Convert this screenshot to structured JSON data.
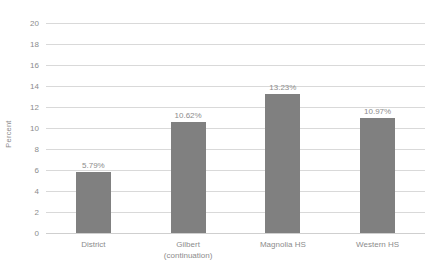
{
  "chart_data": {
    "type": "bar",
    "title": "",
    "subtitle": "",
    "xlabel": "",
    "ylabel": "Percent",
    "ylim": [
      0,
      20
    ],
    "ytick_step": 2,
    "yticks": [
      "20",
      "18",
      "16",
      "14",
      "12",
      "10",
      "8",
      "6",
      "4",
      "2",
      "0"
    ],
    "grid": true,
    "legend": false,
    "categories": [
      "District",
      "Gilbert (continuation)",
      "Magnolia HS",
      "Western HS"
    ],
    "values": [
      5.79,
      10.62,
      13.23,
      10.97
    ],
    "data_labels": [
      "5.79%",
      "10.62%",
      "13.23%",
      "10.97%"
    ],
    "bars": [
      {
        "category_line1": "District",
        "category_line2": "",
        "value": 5.79,
        "label": "5.79%"
      },
      {
        "category_line1": "Gilbert",
        "category_line2": "(continuation)",
        "value": 10.62,
        "label": "10.62%"
      },
      {
        "category_line1": "Magnolia HS",
        "category_line2": "",
        "value": 13.23,
        "label": "13.23%"
      },
      {
        "category_line1": "Western HS",
        "category_line2": "",
        "value": 10.97,
        "label": "10.97%"
      }
    ],
    "colors": {
      "bar": "#808080",
      "gridline": "#d9d9d9",
      "text": "#8c8c8c",
      "background": "#ffffff"
    }
  }
}
